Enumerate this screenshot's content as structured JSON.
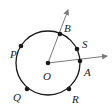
{
  "diagram": {
    "type": "circle-with-central-angle",
    "center": {
      "label": "O",
      "x": 48,
      "y": 63
    },
    "radius": 32,
    "stroke_color": "#1a1a1a",
    "ray_color": "#7a7a7a",
    "points_on_circle": [
      {
        "label": "P",
        "x": 21,
        "y": 46,
        "lx": 10,
        "ly": 55
      },
      {
        "label": "B",
        "x": 60,
        "y": 34,
        "lx": 64,
        "ly": 30
      },
      {
        "label": "S",
        "x": 77,
        "y": 49,
        "lx": 82,
        "ly": 46
      },
      {
        "label": "A",
        "x": 80,
        "y": 61,
        "lx": 84,
        "ly": 74
      },
      {
        "label": "R",
        "x": 69,
        "y": 89,
        "lx": 72,
        "ly": 101
      },
      {
        "label": "Q",
        "x": 27,
        "y": 89,
        "lx": 14,
        "ly": 99
      }
    ],
    "rays": [
      {
        "name": "OB",
        "from": "O",
        "through": "B",
        "end": {
          "x": 68,
          "y": 9
        }
      },
      {
        "name": "OA",
        "from": "O",
        "through": "A",
        "end": {
          "x": 108,
          "y": 56
        }
      }
    ],
    "labels": {
      "O": "O",
      "P": "P",
      "B": "B",
      "S": "S",
      "A": "A",
      "R": "R",
      "Q": "Q"
    }
  }
}
